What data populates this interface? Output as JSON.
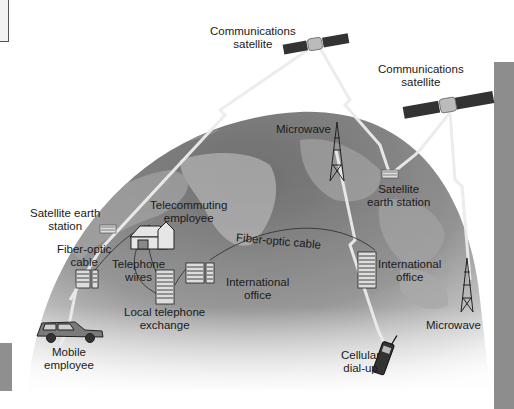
{
  "diagram": {
    "colors": {
      "globe_dark": "#6b6b6b",
      "globe_light": "#b5b5b5",
      "land": "#8a8a8a",
      "beam": "#e6e6e6",
      "text": "#1a1a1a",
      "sidebar": "#8d8d8d"
    },
    "labels": {
      "comm_sat_1": [
        "Communications",
        "satellite"
      ],
      "comm_sat_2": [
        "Communications",
        "satellite"
      ],
      "microwave_top": "Microwave",
      "satellite_earth_station_right": [
        "Satellite",
        "earth station"
      ],
      "satellite_earth_station_left": [
        "Satellite earth",
        "station"
      ],
      "telecommuting_employee": [
        "Telecommuting",
        "employee"
      ],
      "fiber_optic_cable_arc": "Fiber-optic cable",
      "fiber_optic_cable_left": [
        "Fiber-optic",
        "cable"
      ],
      "telephone_wires": [
        "Telephone",
        "wires"
      ],
      "international_office_center": [
        "International",
        "office"
      ],
      "international_office_right": [
        "International",
        "office"
      ],
      "local_telephone_exchange": [
        "Local telephone",
        "exchange"
      ],
      "microwave_right": "Microwave",
      "mobile_employee": [
        "Mobile",
        "employee"
      ],
      "cellular_dial_up": [
        "Cellular",
        "dial-up"
      ]
    },
    "icons": [
      "satellite-icon",
      "satellite-icon",
      "microwave-tower-icon",
      "microwave-tower-icon",
      "earth-station-icon",
      "earth-station-icon",
      "house-icon",
      "office-building-icon",
      "office-building-icon",
      "office-building-icon",
      "telephone-exchange-icon",
      "car-icon",
      "cell-phone-icon"
    ]
  }
}
